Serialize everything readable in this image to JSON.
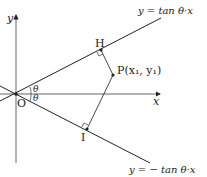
{
  "diagram": {
    "axes": {
      "x_label": "x",
      "y_label": "y",
      "origin_label": "O"
    },
    "lines": [
      {
        "id": "upper",
        "equation": "y = tan θ·x"
      },
      {
        "id": "lower",
        "equation": "y = − tan θ·x"
      }
    ],
    "angles": [
      {
        "label": "θ"
      },
      {
        "label": "θ"
      }
    ],
    "points": {
      "P": "P(x₁, y₁)",
      "H": "H",
      "I": "I"
    }
  }
}
